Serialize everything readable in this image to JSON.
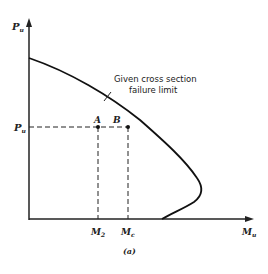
{
  "figure": {
    "caption": "(a)",
    "y_axis_label": "P",
    "y_axis_sub": "u",
    "x_axis_label": "M",
    "x_axis_sub": "u",
    "load_level_label": "P",
    "load_level_sub": "u",
    "point_a_label": "A",
    "point_b_label": "B",
    "m2_label": "M",
    "m2_sub": "2",
    "mc_label": "M",
    "mc_sub": "c",
    "curve_annotation_line1": "Given cross section",
    "curve_annotation_line2": "failure limit"
  }
}
